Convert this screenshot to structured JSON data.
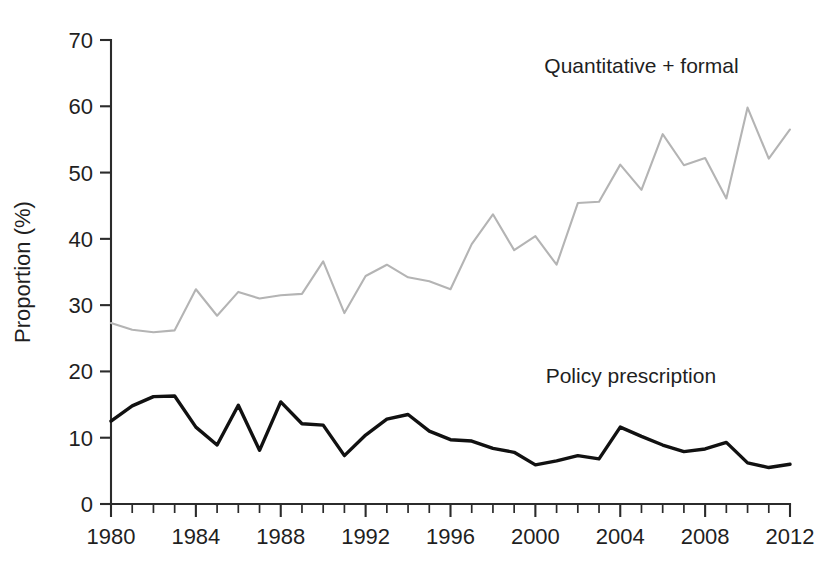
{
  "chart_data": {
    "type": "line",
    "title": "",
    "subtitle": "",
    "xlabel": "",
    "ylabel": "Proportion (%)",
    "xlim": [
      1980,
      2012
    ],
    "ylim": [
      0,
      70
    ],
    "yticks": [
      0,
      10,
      20,
      30,
      40,
      50,
      60,
      70
    ],
    "ytick_labels": [
      "0",
      "10",
      "20",
      "30",
      "40",
      "50",
      "60",
      "70"
    ],
    "xticks": [
      1980,
      1984,
      1988,
      1992,
      1996,
      2000,
      2004,
      2008,
      2012
    ],
    "xtick_labels": [
      "1980",
      "1984",
      "1988",
      "1992",
      "1996",
      "2000",
      "2004",
      "2008",
      "2012"
    ],
    "x_minor_tick_interval": 1,
    "grid": false,
    "legend_position": "inline-annotation",
    "x": [
      1980,
      1981,
      1982,
      1983,
      1984,
      1985,
      1986,
      1987,
      1988,
      1989,
      1990,
      1991,
      1992,
      1993,
      1994,
      1995,
      1996,
      1997,
      1998,
      1999,
      2000,
      2001,
      2002,
      2003,
      2004,
      2005,
      2006,
      2007,
      2008,
      2009,
      2010,
      2011,
      2012
    ],
    "series": [
      {
        "name": "Quantitative + formal",
        "color": "#b4b4b4",
        "label_x": 2005,
        "label_y": 65,
        "values": [
          27.3,
          26.3,
          25.9,
          26.2,
          32.4,
          28.4,
          32.0,
          31.0,
          31.5,
          31.7,
          36.6,
          28.8,
          34.4,
          36.1,
          34.2,
          33.6,
          32.4,
          39.2,
          43.7,
          38.3,
          40.4,
          36.1,
          45.4,
          45.6,
          51.2,
          47.4,
          55.8,
          51.1,
          52.2,
          46.1,
          59.8,
          52.1,
          56.5
        ]
      },
      {
        "name": "Policy prescription",
        "color": "#111111",
        "label_x": 2004.5,
        "label_y": 18.2,
        "values": [
          12.5,
          14.8,
          16.2,
          16.3,
          11.6,
          8.9,
          14.9,
          8.1,
          15.4,
          12.1,
          11.9,
          7.3,
          10.4,
          12.8,
          13.5,
          11.0,
          9.7,
          9.5,
          8.4,
          7.8,
          5.9,
          6.5,
          7.3,
          6.8,
          11.6,
          10.2,
          8.9,
          7.9,
          8.3,
          9.3,
          6.2,
          5.5,
          6.0
        ]
      }
    ]
  }
}
